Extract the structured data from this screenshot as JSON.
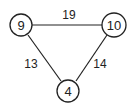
{
  "graph": {
    "nodes": [
      {
        "id": "a",
        "label": "9"
      },
      {
        "id": "b",
        "label": "10"
      },
      {
        "id": "c",
        "label": "4"
      }
    ],
    "edges": [
      {
        "from": "a",
        "to": "b",
        "label": "19"
      },
      {
        "from": "a",
        "to": "c",
        "label": "13"
      },
      {
        "from": "b",
        "to": "c",
        "label": "14"
      }
    ]
  }
}
